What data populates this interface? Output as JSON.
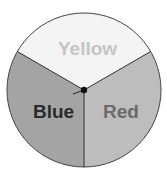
{
  "spinner": {
    "sections": [
      {
        "label": "Yellow",
        "fill": "#f4f4f4",
        "text_color": "#c4c4c4"
      },
      {
        "label": "Red",
        "fill": "#bdbdbd",
        "text_color": "#6b6b6b"
      },
      {
        "label": "Blue",
        "fill": "#a4a4a4",
        "text_color": "#2a2a2a"
      }
    ],
    "outline_color": "#444444"
  }
}
